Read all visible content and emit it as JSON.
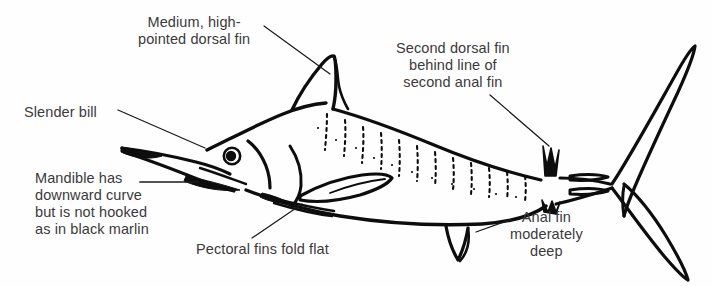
{
  "figure": {
    "background_color": "#ffffff",
    "ink_color": "#0d0d0d",
    "text_color": "#3a3a3c"
  },
  "labels": [
    {
      "id": "medium-dorsal-fin",
      "lines": [
        "Medium, high-",
        "pointed dorsal fin"
      ],
      "align": "center",
      "leader": {
        "from": [
          264,
          26
        ],
        "to": [
          330,
          74
        ]
      }
    },
    {
      "id": "second-dorsal-fin",
      "lines": [
        "Second dorsal fin",
        "behind line of",
        "second anal fin"
      ],
      "align": "center",
      "leader": {
        "from": [
          490,
          95
        ],
        "to": [
          549,
          146
        ]
      }
    },
    {
      "id": "slender-bill",
      "lines": [
        "Slender bill"
      ],
      "align": "left",
      "leader": {
        "from": [
          118,
          110
        ],
        "to": [
          205,
          148
        ]
      }
    },
    {
      "id": "mandible",
      "lines": [
        "Mandible has",
        "downward curve",
        "but is not hooked",
        "as in black marlin"
      ],
      "align": "left",
      "leader": {
        "from": [
          140,
          182
        ],
        "to": [
          196,
          182
        ]
      }
    },
    {
      "id": "pectoral-fins",
      "lines": [
        "Pectoral fins fold flat"
      ],
      "align": "left",
      "leader": {
        "from": [
          252,
          238
        ],
        "to": [
          302,
          204
        ]
      }
    },
    {
      "id": "anal-fin",
      "lines": [
        "Anal fin",
        "moderately",
        "deep"
      ],
      "align": "center",
      "leader": {
        "from": [
          512,
          219
        ],
        "to": [
          476,
          232
        ]
      }
    }
  ]
}
